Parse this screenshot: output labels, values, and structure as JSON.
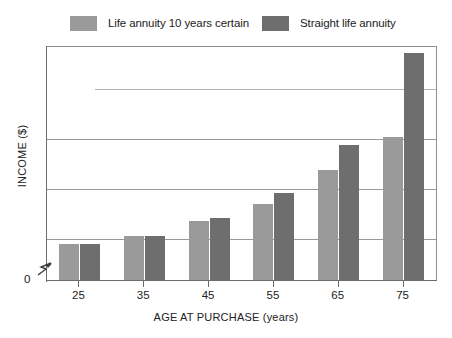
{
  "chart_data": {
    "type": "bar",
    "title": "",
    "xlabel": "AGE AT PURCHASE (years)",
    "ylabel": "INCOME ($)",
    "categories": [
      "25",
      "35",
      "45",
      "55",
      "65",
      "75"
    ],
    "series": [
      {
        "name": "Life annuity 10 years certain",
        "color": "#9a9a9a",
        "values": [
          36,
          44,
          60,
          77,
          111,
          144
        ]
      },
      {
        "name": "Straight life annuity",
        "color": "#6e6e6e",
        "values": [
          36,
          44,
          63,
          88,
          136,
          229
        ]
      }
    ],
    "ylim": [
      0,
      235
    ],
    "ytick_labels": [
      "0"
    ],
    "grid": true,
    "gridlines_y": [
      42,
      92,
      142,
      192
    ],
    "legend_position": "top",
    "axis_break": "y-axis break below first gridline"
  },
  "legend": {
    "items": [
      {
        "label": "Life annuity 10 years certain",
        "color": "#9a9a9a",
        "icon": "legend-swatch-light"
      },
      {
        "label": "Straight life annuity",
        "color": "#6e6e6e",
        "icon": "legend-swatch-dark"
      }
    ]
  },
  "axes": {
    "y": {
      "title": "INCOME ($)",
      "origin_label": "0"
    },
    "x": {
      "title": "AGE AT PURCHASE (years)",
      "ticks": [
        "25",
        "35",
        "45",
        "55",
        "65",
        "75"
      ]
    }
  },
  "colors": {
    "series_light": "#9a9a9a",
    "series_dark": "#6e6e6e",
    "frame": "#8e8e8e",
    "gridline": "#9a9a9a",
    "gridline_partial": "#b4b4b4",
    "background": "#ffffff",
    "text": "#222222"
  }
}
